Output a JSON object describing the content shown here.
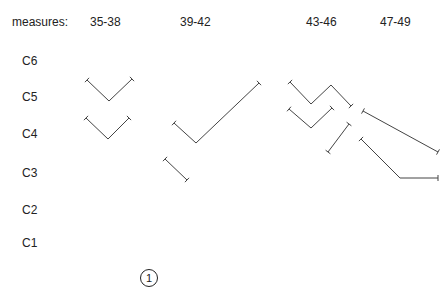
{
  "header": {
    "measures_label": "measures:",
    "columns": [
      "35-38",
      "39-42",
      "43-46",
      "47-49"
    ]
  },
  "y_axis": {
    "labels": [
      "C6",
      "C5",
      "C4",
      "C3",
      "C2",
      "C1"
    ]
  },
  "figure_number": "1",
  "line_color": "#444444",
  "paths": [
    {
      "name": "v-upper-35-38",
      "points": [
        [
          87,
          80
        ],
        [
          109,
          101
        ],
        [
          132,
          79
        ]
      ]
    },
    {
      "name": "v-lower-35-38",
      "points": [
        [
          86,
          118
        ],
        [
          108,
          139
        ],
        [
          129,
          118
        ]
      ]
    },
    {
      "name": "check-39-42",
      "points": [
        [
          174,
          123
        ],
        [
          196,
          143
        ],
        [
          259,
          83
        ]
      ]
    },
    {
      "name": "short-39-42",
      "points": [
        [
          165,
          159
        ],
        [
          187,
          180
        ]
      ]
    },
    {
      "name": "w-upper-43-46",
      "points": [
        [
          290,
          82
        ],
        [
          311,
          104
        ],
        [
          331,
          85
        ],
        [
          351,
          106
        ]
      ]
    },
    {
      "name": "v-lower-43-46",
      "points": [
        [
          289,
          109
        ],
        [
          311,
          128
        ],
        [
          332,
          108
        ]
      ]
    },
    {
      "name": "short-43-46",
      "points": [
        [
          328,
          152
        ],
        [
          349,
          124
        ]
      ]
    },
    {
      "name": "long-upper-47-49",
      "points": [
        [
          363,
          111
        ],
        [
          438,
          152
        ]
      ]
    },
    {
      "name": "long-lower-47-49",
      "points": [
        [
          361,
          139
        ],
        [
          400,
          178
        ],
        [
          438,
          178
        ]
      ]
    }
  ]
}
